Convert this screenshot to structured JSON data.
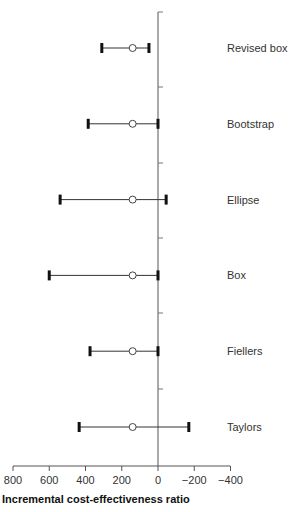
{
  "chart_data": {
    "type": "forest",
    "title": "",
    "xlabel": "Incremental cost-effectiveness ratio",
    "ylabel": "",
    "x_reversed": true,
    "xlim": [
      800,
      -400
    ],
    "xticks": [
      800,
      600,
      400,
      200,
      0,
      -200,
      -400
    ],
    "xtick_labels": [
      "800",
      "600",
      "400",
      "200",
      "0",
      "−200",
      "−400"
    ],
    "grid": false,
    "series": [
      {
        "name": "Revised box",
        "estimate": 140,
        "lower": 310,
        "upper": 50
      },
      {
        "name": "Bootstrap",
        "estimate": 140,
        "lower": 385,
        "upper": 0
      },
      {
        "name": "Ellipse",
        "estimate": 140,
        "lower": 540,
        "upper": -45
      },
      {
        "name": "Box",
        "estimate": 140,
        "lower": 600,
        "upper": 0
      },
      {
        "name": "Fiellers",
        "estimate": 140,
        "lower": 375,
        "upper": 0
      },
      {
        "name": "Taylors",
        "estimate": 140,
        "lower": 435,
        "upper": -170
      }
    ]
  }
}
